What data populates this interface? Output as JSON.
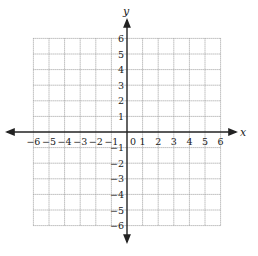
{
  "diagram": {
    "type": "coordinate-grid",
    "x_axis": {
      "label": "x",
      "min": -6,
      "max": 6,
      "tick_labels": [
        "-6",
        "-5",
        "-4",
        "-3",
        "-2",
        "-1",
        "0",
        "1",
        "2",
        "3",
        "4",
        "5",
        "6"
      ]
    },
    "y_axis": {
      "label": "y",
      "min": -6,
      "max": 6,
      "tick_labels": [
        "6",
        "5",
        "4",
        "3",
        "2",
        "1",
        "-1",
        "-2",
        "-3",
        "-4",
        "-5",
        "-6"
      ]
    },
    "grid": {
      "style": "dotted",
      "major_every": 1,
      "color": "#9a9a9a",
      "axis_color": "#222222"
    },
    "minus_sign": "−"
  }
}
